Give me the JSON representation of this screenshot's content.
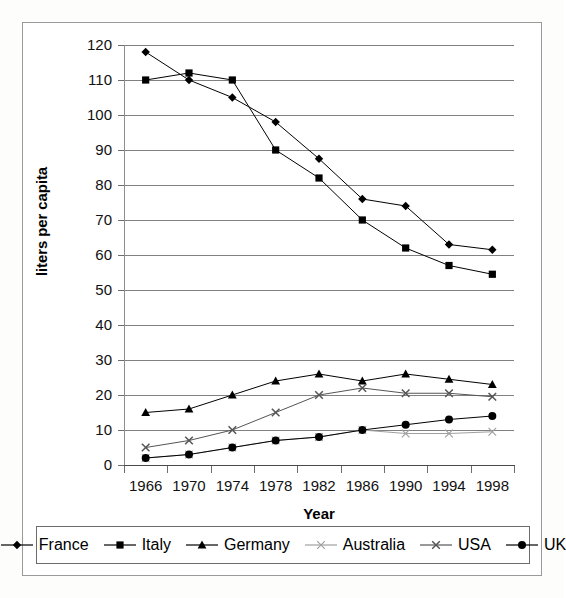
{
  "chart_data": {
    "type": "line",
    "title": "",
    "xlabel": "Year",
    "ylabel": "liters per capita",
    "x": [
      1966,
      1970,
      1974,
      1978,
      1982,
      1986,
      1990,
      1994,
      1998
    ],
    "xticklabels": [
      "1966",
      "1970",
      "1974",
      "1978",
      "1982",
      "1986",
      "1990",
      "1994",
      "1998"
    ],
    "yticklabels": [
      "0",
      "10",
      "20",
      "30",
      "40",
      "50",
      "60",
      "70",
      "80",
      "90",
      "100",
      "110",
      "120"
    ],
    "yticks": [
      0,
      10,
      20,
      30,
      40,
      50,
      60,
      70,
      80,
      90,
      100,
      110,
      120
    ],
    "ylim": [
      0,
      120
    ],
    "grid": "horizontal",
    "legend_position": "bottom",
    "series": [
      {
        "name": "France",
        "marker": "diamond",
        "color": "#000000",
        "values": [
          118,
          110,
          105,
          98,
          87.5,
          76,
          74,
          63,
          61.5
        ]
      },
      {
        "name": "Italy",
        "marker": "square",
        "color": "#000000",
        "values": [
          110,
          112,
          110,
          90,
          82,
          70,
          62,
          57,
          54.5
        ]
      },
      {
        "name": "Germany",
        "marker": "triangle",
        "color": "#000000",
        "values": [
          15,
          16,
          20,
          24,
          26,
          24,
          26,
          24.5,
          23
        ]
      },
      {
        "name": "Australia",
        "marker": "x-light",
        "color": "#a0a0a0",
        "values": [
          2,
          3,
          5,
          7,
          8,
          10,
          9,
          9,
          9.5
        ]
      },
      {
        "name": "USA",
        "marker": "x-dark",
        "color": "#555555",
        "values": [
          5,
          7,
          10,
          15,
          20,
          22,
          20.5,
          20.5,
          19.5
        ]
      },
      {
        "name": "UK",
        "marker": "circle",
        "color": "#000000",
        "values": [
          2,
          3,
          5,
          7,
          8,
          10,
          11.5,
          13,
          14
        ]
      }
    ]
  },
  "legend": {
    "items": [
      {
        "label": "France"
      },
      {
        "label": "Italy"
      },
      {
        "label": "Germany"
      },
      {
        "label": "Australia"
      },
      {
        "label": "USA"
      },
      {
        "label": "UK"
      }
    ]
  }
}
